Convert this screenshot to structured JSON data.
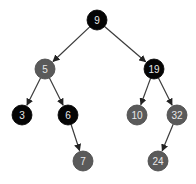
{
  "diagram": {
    "type": "red-black-tree",
    "colors": {
      "black": "#050505",
      "red_gray": "#5a5a5a",
      "edge": "#3a3a3a",
      "label": "#e8e8e8"
    },
    "nodes": [
      {
        "id": "n9",
        "label": "9",
        "color": "black",
        "x": 97,
        "y": 20
      },
      {
        "id": "n5",
        "label": "5",
        "color": "red",
        "x": 45,
        "y": 69
      },
      {
        "id": "n19",
        "label": "19",
        "color": "black",
        "x": 154,
        "y": 69
      },
      {
        "id": "n3",
        "label": "3",
        "color": "black",
        "x": 22,
        "y": 115
      },
      {
        "id": "n6",
        "label": "6",
        "color": "black",
        "x": 68,
        "y": 115
      },
      {
        "id": "n10",
        "label": "10",
        "color": "red",
        "x": 137,
        "y": 115
      },
      {
        "id": "n32",
        "label": "32",
        "color": "red",
        "x": 177,
        "y": 115
      },
      {
        "id": "n7",
        "label": "7",
        "color": "red",
        "x": 83,
        "y": 161
      },
      {
        "id": "n24",
        "label": "24",
        "color": "red",
        "x": 158,
        "y": 161
      }
    ],
    "edges": [
      {
        "from": "n9",
        "to": "n5"
      },
      {
        "from": "n9",
        "to": "n19"
      },
      {
        "from": "n5",
        "to": "n3"
      },
      {
        "from": "n5",
        "to": "n6"
      },
      {
        "from": "n19",
        "to": "n10"
      },
      {
        "from": "n19",
        "to": "n32"
      },
      {
        "from": "n6",
        "to": "n7"
      },
      {
        "from": "n32",
        "to": "n24"
      }
    ]
  }
}
